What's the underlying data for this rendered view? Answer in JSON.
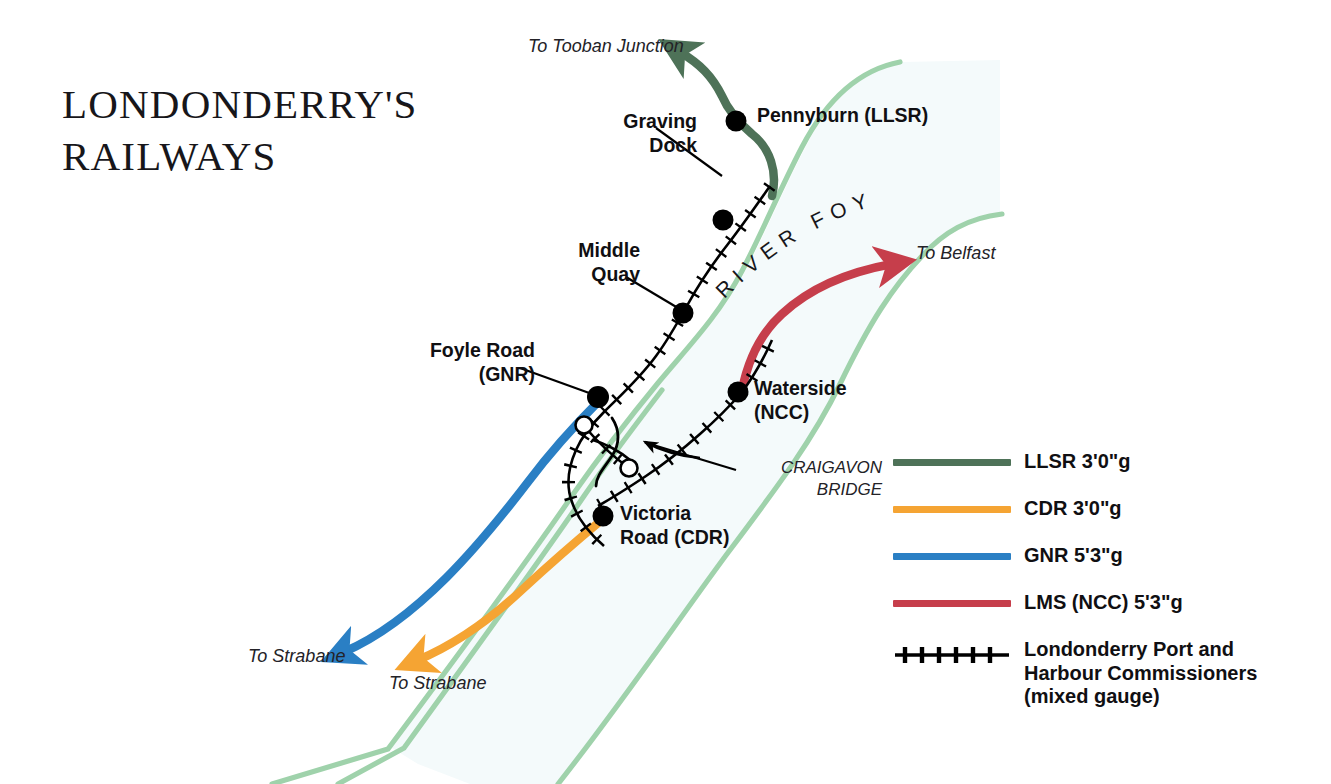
{
  "title": {
    "line1": "LONDONDERRY'S",
    "line2": "RAILWAYS"
  },
  "river": {
    "name": "RIVER FOYLE",
    "bank_color": "#9fd2ab",
    "fill_color": "#f4fafb"
  },
  "stations": [
    {
      "id": "pennyburn",
      "label_line1": "Pennyburn (LLSR)",
      "label_line2": "",
      "x": 736,
      "y": 121,
      "marker": "filled"
    },
    {
      "id": "graving-dock",
      "label_line1": "Graving",
      "label_line2": "Dock",
      "x": 723,
      "y": 220,
      "marker": "filled"
    },
    {
      "id": "middle-quay",
      "label_line1": "Middle",
      "label_line2": "Quay",
      "x": 683,
      "y": 313,
      "marker": "filled"
    },
    {
      "id": "foyle-road",
      "label_line1": "Foyle Road",
      "label_line2": "(GNR)",
      "x": 598,
      "y": 397,
      "marker": "filled"
    },
    {
      "id": "waterside",
      "label_line1": "Waterside",
      "label_line2": "(NCC)",
      "x": 738,
      "y": 392,
      "marker": "filled"
    },
    {
      "id": "victoria-road",
      "label_line1": "Victoria",
      "label_line2": "Road (CDR)",
      "x": 603,
      "y": 516,
      "marker": "filled"
    },
    {
      "id": "bridge-north",
      "label_line1": "",
      "label_line2": "",
      "x": 584,
      "y": 425,
      "marker": "hollow"
    },
    {
      "id": "bridge-south",
      "label_line1": "",
      "label_line2": "",
      "x": 629,
      "y": 468,
      "marker": "hollow"
    }
  ],
  "station_labels": [
    {
      "name": "pennyburn-label",
      "text": "Pennyburn (LLSR)",
      "x": 757,
      "y": 105,
      "align": "left"
    },
    {
      "name": "graving-dock-label",
      "text_line1": "Graving",
      "text_line2": "Dock",
      "x": 582,
      "y": 111,
      "align": "right",
      "width": 115
    },
    {
      "name": "middle-quay-label",
      "text_line1": "Middle",
      "text_line2": "Quay",
      "x": 530,
      "y": 240,
      "align": "right",
      "width": 110
    },
    {
      "name": "foyle-road-label",
      "text_line1": "Foyle Road",
      "text_line2": "(GNR)",
      "x": 385,
      "y": 340,
      "align": "right",
      "width": 150
    },
    {
      "name": "waterside-label",
      "text_line1": "Waterside",
      "text_line2": "(NCC)",
      "x": 754,
      "y": 378,
      "align": "left",
      "width": 160
    },
    {
      "name": "victoria-road-label",
      "text_line1": "Victoria",
      "text_line2": "Road (CDR)",
      "x": 620,
      "y": 503,
      "align": "left",
      "width": 170
    }
  ],
  "destinations": [
    {
      "name": "to-tooban-junction",
      "text": "To Tooban Junction",
      "x": 528,
      "y": 36
    },
    {
      "name": "to-belfast",
      "text": "To Belfast",
      "x": 916,
      "y": 243
    },
    {
      "name": "to-strabane-gnr",
      "text": "To Strabane",
      "x": 248,
      "y": 646
    },
    {
      "name": "to-strabane-cdr",
      "text": "To Strabane",
      "x": 389,
      "y": 673
    }
  ],
  "annotations": [
    {
      "name": "craigavon-bridge-label",
      "line1": "CRAIGAVON",
      "line2": "BRIDGE",
      "x": 742,
      "y": 457,
      "width": 140
    }
  ],
  "legend": {
    "items": [
      {
        "id": "llsr",
        "color": "#4e7258",
        "label": "LLSR  3'0\"g",
        "style": "line"
      },
      {
        "id": "cdr",
        "color": "#f5a433",
        "label": "CDR  3'0\"g",
        "style": "line"
      },
      {
        "id": "gnr",
        "color": "#2a7fc4",
        "label": "GNR  5'3\"g",
        "style": "line"
      },
      {
        "id": "lms",
        "color": "#c63e4b",
        "label": "LMS (NCC)  5'3\"g",
        "style": "line"
      },
      {
        "id": "harbour",
        "color": "#000000",
        "style": "hatched",
        "label": "Londonderry Port and",
        "label2": "Harbour Commissioners",
        "label3": "(mixed gauge)"
      }
    ]
  },
  "lines": {
    "llsr_color": "#4e7258",
    "cdr_color": "#f5a433",
    "gnr_color": "#2a7fc4",
    "lms_color": "#c63e4b",
    "harbour_color": "#000000"
  }
}
